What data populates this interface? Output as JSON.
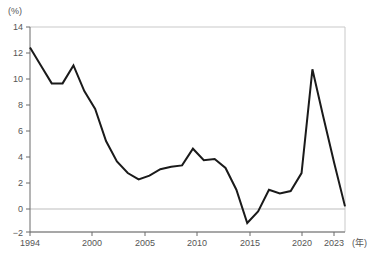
{
  "chart_data": {
    "type": "line",
    "title": "",
    "subtitle": "",
    "xlabel": "(年)",
    "ylabel": "(%)",
    "xlim": [
      1994,
      2023
    ],
    "ylim": [
      -2,
      14
    ],
    "grid": true,
    "legend": null,
    "legend_position": "none",
    "y_unit_label": "(%)",
    "x_unit_label": "(年)",
    "yticks": [
      -2,
      0,
      2,
      4,
      6,
      8,
      10,
      12,
      14
    ],
    "ytick_labels": [
      "−2",
      "0",
      "2",
      "4",
      "6",
      "8",
      "10",
      "12",
      "14"
    ],
    "xticks": [
      1994,
      2000,
      2005,
      2010,
      2015,
      2020,
      2023
    ],
    "xtick_labels": [
      "1994",
      "2000",
      "2005",
      "2010",
      "2015",
      "2020",
      "2023"
    ],
    "series": [
      {
        "name": "",
        "color": "#1a1a1a",
        "x": [
          1994,
          1995,
          1996,
          1997,
          1998,
          1999,
          2000,
          2001,
          2002,
          2003,
          2004,
          2005,
          2006,
          2007,
          2008,
          2009,
          2010,
          2011,
          2012,
          2013,
          2014,
          2015,
          2016,
          2017,
          2018,
          2019,
          2020,
          2021,
          2022,
          2023
        ],
        "values": [
          12.4,
          11.0,
          9.6,
          9.6,
          11.0,
          9.0,
          7.6,
          5.1,
          3.5,
          2.6,
          2.1,
          2.4,
          2.9,
          3.1,
          3.2,
          4.5,
          3.6,
          3.7,
          3.0,
          1.3,
          -1.3,
          -0.4,
          1.3,
          1.0,
          1.2,
          2.6,
          10.7,
          7.0,
          3.4,
          0.0
        ]
      }
    ]
  }
}
